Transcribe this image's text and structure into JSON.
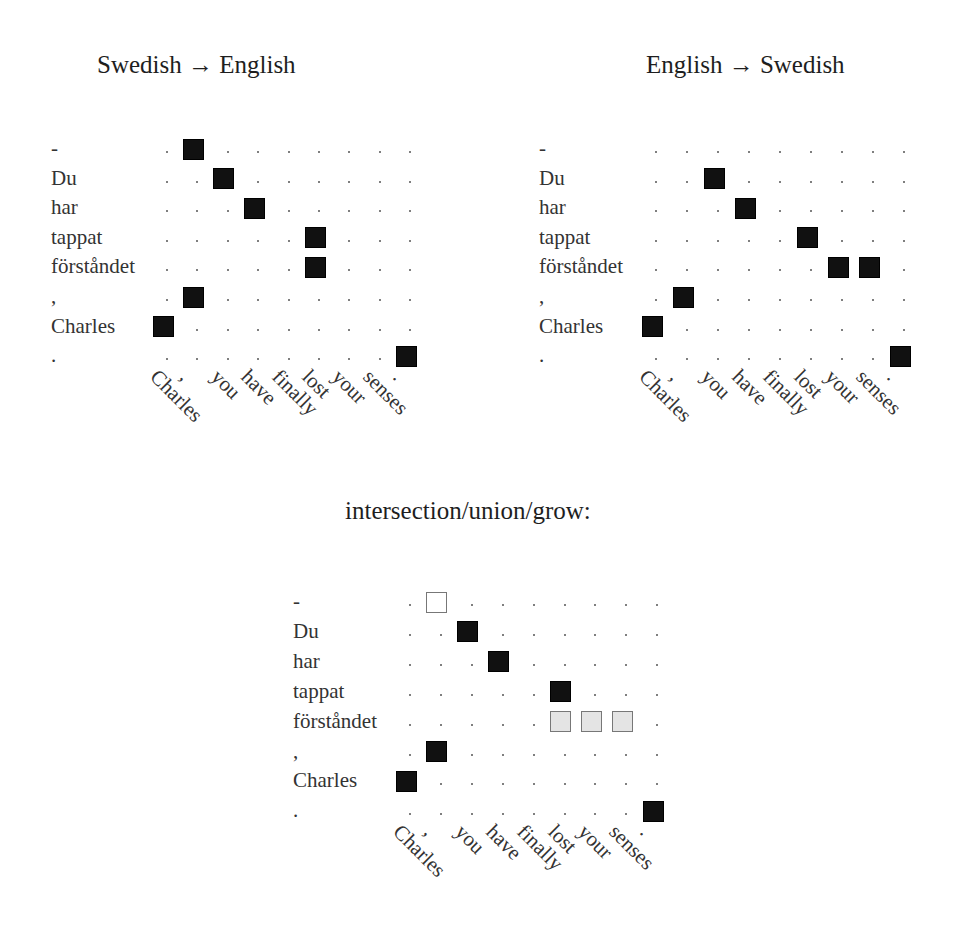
{
  "figure": {
    "rows": [
      "-",
      "Du",
      "har",
      "tappat",
      "förståndet",
      ",",
      "Charles",
      "."
    ],
    "cols": [
      "Charles",
      ",",
      "you",
      "have",
      "finally",
      "lost",
      "your",
      "senses",
      "."
    ],
    "panels": [
      {
        "title": "Swedish → English",
        "title_pos": [
          97,
          52
        ],
        "label_x": 51,
        "origin": [
          163,
          149
        ],
        "col_step": 30.4,
        "row_step": 29.6,
        "cells": [
          {
            "r": 0,
            "c": 1,
            "type": "black"
          },
          {
            "r": 1,
            "c": 2,
            "type": "black"
          },
          {
            "r": 2,
            "c": 3,
            "type": "black"
          },
          {
            "r": 3,
            "c": 5,
            "type": "black"
          },
          {
            "r": 4,
            "c": 5,
            "type": "black"
          },
          {
            "r": 5,
            "c": 1,
            "type": "black"
          },
          {
            "r": 6,
            "c": 0,
            "type": "black"
          },
          {
            "r": 7,
            "c": 8,
            "type": "black"
          }
        ]
      },
      {
        "title": "English → Swedish",
        "title_pos": [
          646,
          52
        ],
        "label_x": 539,
        "origin": [
          652,
          149
        ],
        "col_step": 31,
        "row_step": 29.6,
        "cells": [
          {
            "r": 1,
            "c": 2,
            "type": "black"
          },
          {
            "r": 2,
            "c": 3,
            "type": "black"
          },
          {
            "r": 3,
            "c": 5,
            "type": "black"
          },
          {
            "r": 4,
            "c": 6,
            "type": "black"
          },
          {
            "r": 4,
            "c": 7,
            "type": "black"
          },
          {
            "r": 5,
            "c": 1,
            "type": "black"
          },
          {
            "r": 6,
            "c": 0,
            "type": "black"
          },
          {
            "r": 7,
            "c": 8,
            "type": "black"
          }
        ]
      },
      {
        "title": "intersection/union/grow:",
        "title_pos": [
          345,
          498
        ],
        "label_x": 293,
        "origin": [
          406,
          602
        ],
        "col_step": 30.9,
        "row_step": 29.9,
        "cells": [
          {
            "r": 0,
            "c": 1,
            "type": "union"
          },
          {
            "r": 1,
            "c": 2,
            "type": "black"
          },
          {
            "r": 2,
            "c": 3,
            "type": "black"
          },
          {
            "r": 3,
            "c": 5,
            "type": "black"
          },
          {
            "r": 4,
            "c": 5,
            "type": "grow"
          },
          {
            "r": 4,
            "c": 6,
            "type": "grow"
          },
          {
            "r": 4,
            "c": 7,
            "type": "grow"
          },
          {
            "r": 5,
            "c": 1,
            "type": "black"
          },
          {
            "r": 6,
            "c": 0,
            "type": "black"
          },
          {
            "r": 7,
            "c": 8,
            "type": "black"
          }
        ]
      }
    ],
    "colors": {
      "alignment_point": "#111111",
      "grow_fill": "#e4e4e4",
      "grow_border": "#777777",
      "union_fill": "#ffffff",
      "dot": "#555555"
    }
  }
}
